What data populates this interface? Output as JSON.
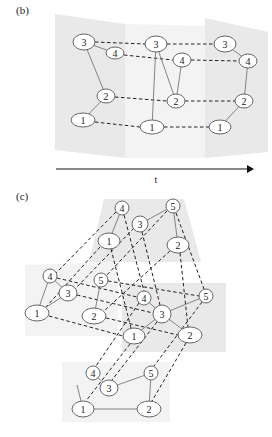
{
  "panel_b": {
    "label": "(b)",
    "axis_label": "t",
    "slices": [
      {
        "name": "slice-1",
        "nodes": [
          {
            "id": "1",
            "x": 83,
            "y": 120,
            "rx": 12,
            "ry": 7
          },
          {
            "id": "2",
            "x": 106,
            "y": 96,
            "rx": 9,
            "ry": 7
          },
          {
            "id": "3",
            "x": 84,
            "y": 42,
            "rx": 11,
            "ry": 8
          },
          {
            "id": "4",
            "x": 115,
            "y": 53,
            "rx": 9,
            "ry": 6
          }
        ],
        "edges": [
          [
            "1",
            "2"
          ],
          [
            "2",
            "3"
          ],
          [
            "3",
            "4"
          ]
        ]
      },
      {
        "name": "slice-2",
        "nodes": [
          {
            "id": "1",
            "x": 152,
            "y": 127,
            "rx": 12,
            "ry": 7
          },
          {
            "id": "2",
            "x": 176,
            "y": 101,
            "rx": 9,
            "ry": 7
          },
          {
            "id": "3",
            "x": 156,
            "y": 44,
            "rx": 11,
            "ry": 8
          },
          {
            "id": "4",
            "x": 182,
            "y": 60,
            "rx": 9,
            "ry": 7
          }
        ],
        "edges": [
          [
            "1",
            "3"
          ],
          [
            "2",
            "3"
          ],
          [
            "2",
            "4"
          ]
        ]
      },
      {
        "name": "slice-3",
        "nodes": [
          {
            "id": "1",
            "x": 220,
            "y": 127,
            "rx": 11,
            "ry": 7
          },
          {
            "id": "2",
            "x": 244,
            "y": 101,
            "rx": 9,
            "ry": 7
          },
          {
            "id": "3",
            "x": 225,
            "y": 44,
            "rx": 11,
            "ry": 8
          },
          {
            "id": "4",
            "x": 248,
            "y": 61,
            "rx": 9,
            "ry": 7
          }
        ],
        "edges": [
          [
            "1",
            "2"
          ],
          [
            "2",
            "4"
          ],
          [
            "3",
            "4"
          ]
        ]
      }
    ]
  },
  "panel_c": {
    "label": "(c)",
    "layers": [
      {
        "name": "top",
        "nodes": [
          {
            "id": "1",
            "x": 109,
            "y": 241,
            "rx": 11,
            "ry": 8
          },
          {
            "id": "2",
            "x": 178,
            "y": 245,
            "rx": 11,
            "ry": 8
          },
          {
            "id": "3",
            "x": 140,
            "y": 224,
            "rx": 8,
            "ry": 8
          },
          {
            "id": "4",
            "x": 122,
            "y": 208,
            "rx": 7,
            "ry": 7
          },
          {
            "id": "5",
            "x": 173,
            "y": 206,
            "rx": 7,
            "ry": 7
          }
        ],
        "edges": [
          [
            "1",
            "4"
          ],
          [
            "3",
            "5"
          ],
          [
            "2",
            "5"
          ]
        ]
      },
      {
        "name": "middle-left",
        "nodes": [
          {
            "id": "1",
            "x": 37,
            "y": 313,
            "rx": 12,
            "ry": 8
          },
          {
            "id": "2",
            "x": 94,
            "y": 316,
            "rx": 12,
            "ry": 8
          },
          {
            "id": "3",
            "x": 68,
            "y": 293,
            "rx": 9,
            "ry": 8
          },
          {
            "id": "4",
            "x": 50,
            "y": 276,
            "rx": 7,
            "ry": 7
          },
          {
            "id": "5",
            "x": 101,
            "y": 280,
            "rx": 7,
            "ry": 7
          }
        ],
        "edges": [
          [
            "1",
            "4"
          ],
          [
            "1",
            "3"
          ],
          [
            "3",
            "4"
          ],
          [
            "2",
            "5"
          ]
        ]
      },
      {
        "name": "middle-right",
        "nodes": [
          {
            "id": "1",
            "x": 134,
            "y": 336,
            "rx": 11,
            "ry": 8
          },
          {
            "id": "2",
            "x": 190,
            "y": 335,
            "rx": 12,
            "ry": 8
          },
          {
            "id": "3",
            "x": 162,
            "y": 314,
            "rx": 9,
            "ry": 9
          },
          {
            "id": "4",
            "x": 144,
            "y": 298,
            "rx": 7,
            "ry": 7
          },
          {
            "id": "5",
            "x": 206,
            "y": 296,
            "rx": 7,
            "ry": 7
          }
        ],
        "edges": [
          [
            "3",
            "4"
          ],
          [
            "3",
            "5"
          ],
          [
            "1",
            "3"
          ],
          [
            "2",
            "3"
          ]
        ]
      },
      {
        "name": "bottom",
        "nodes": [
          {
            "id": "1",
            "x": 83,
            "y": 409,
            "rx": 11,
            "ry": 8
          },
          {
            "id": "2",
            "x": 149,
            "y": 409,
            "rx": 12,
            "ry": 8
          },
          {
            "id": "3",
            "x": 109,
            "y": 388,
            "rx": 9,
            "ry": 8
          },
          {
            "id": "4",
            "x": 93,
            "y": 373,
            "rx": 7,
            "ry": 7
          },
          {
            "id": "5",
            "x": 151,
            "y": 373,
            "rx": 7,
            "ry": 7
          }
        ],
        "edges": [
          [
            "1",
            "2"
          ],
          [
            "2",
            "5"
          ],
          [
            "3",
            "5"
          ],
          [
            "3",
            "4"
          ]
        ]
      }
    ]
  }
}
